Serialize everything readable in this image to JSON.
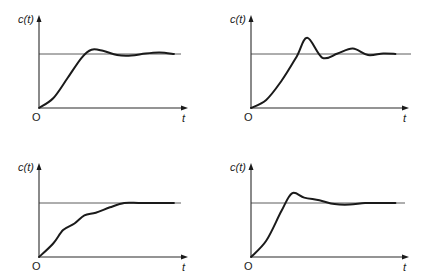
{
  "figure": {
    "panels": [
      {
        "id": "top-left",
        "y_label": "c(t)",
        "x_label": "t",
        "origin_label": "O",
        "response": "underdamped, moderate overshoot, small decaying oscillation"
      },
      {
        "id": "top-right",
        "y_label": "c(t)",
        "x_label": "t",
        "origin_label": "O",
        "response": "underdamped, large overshoot, pronounced decaying oscillation"
      },
      {
        "id": "bottom-left",
        "y_label": "c(t)",
        "x_label": "t",
        "origin_label": "O",
        "response": "monotonic rise with ripples, no overshoot"
      },
      {
        "id": "bottom-right",
        "y_label": "c(t)",
        "x_label": "t",
        "origin_label": "O",
        "response": "overshoot followed by shoulder and settling"
      }
    ]
  },
  "chart_data": [
    {
      "type": "line",
      "title": "",
      "xlabel": "t",
      "ylabel": "c(t)",
      "steady_state": 1.0,
      "series": [
        {
          "name": "c(t)",
          "x": [
            0,
            0.1,
            0.2,
            0.3,
            0.37,
            0.45,
            0.55,
            0.65,
            0.75,
            0.85,
            0.95
          ],
          "values": [
            0,
            0.18,
            0.55,
            0.93,
            1.08,
            1.06,
            0.98,
            0.97,
            1.01,
            1.03,
            1.0
          ]
        }
      ]
    },
    {
      "type": "line",
      "title": "",
      "xlabel": "t",
      "ylabel": "c(t)",
      "steady_state": 1.0,
      "series": [
        {
          "name": "c(t)",
          "x": [
            0,
            0.1,
            0.2,
            0.3,
            0.37,
            0.47,
            0.57,
            0.67,
            0.77,
            0.87,
            0.95
          ],
          "values": [
            0,
            0.15,
            0.5,
            0.95,
            1.3,
            0.93,
            1.01,
            1.1,
            0.98,
            1.01,
            1.0
          ]
        }
      ]
    },
    {
      "type": "line",
      "title": "",
      "xlabel": "t",
      "ylabel": "c(t)",
      "steady_state": 1.0,
      "series": [
        {
          "name": "c(t)",
          "x": [
            0,
            0.1,
            0.17,
            0.25,
            0.32,
            0.4,
            0.5,
            0.6,
            0.7,
            0.8,
            0.95
          ],
          "values": [
            0,
            0.25,
            0.5,
            0.62,
            0.77,
            0.82,
            0.92,
            1.0,
            1.0,
            1.0,
            1.0
          ]
        }
      ]
    },
    {
      "type": "line",
      "title": "",
      "xlabel": "t",
      "ylabel": "c(t)",
      "steady_state": 1.0,
      "series": [
        {
          "name": "c(t)",
          "x": [
            0,
            0.1,
            0.2,
            0.27,
            0.35,
            0.45,
            0.55,
            0.65,
            0.75,
            0.85,
            0.95
          ],
          "values": [
            0,
            0.3,
            0.85,
            1.18,
            1.1,
            1.05,
            0.98,
            0.97,
            1.0,
            1.0,
            1.0
          ]
        }
      ]
    }
  ]
}
